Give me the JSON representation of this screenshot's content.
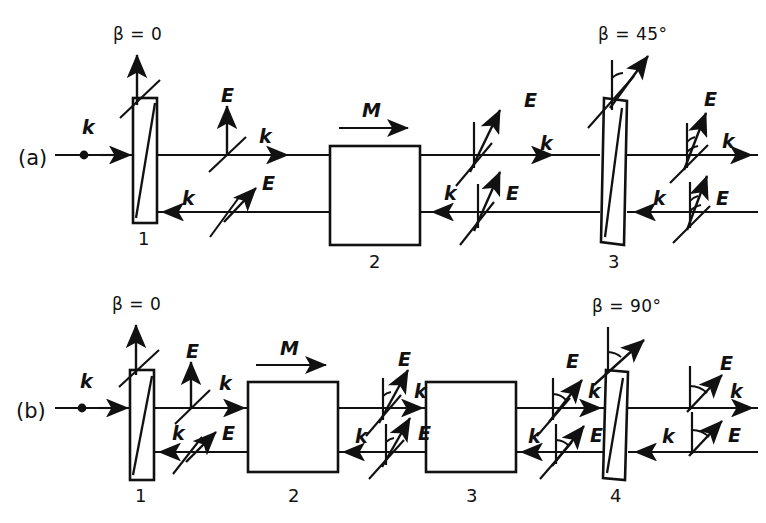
{
  "figure": {
    "type": "optical-schematic",
    "background_color": "#ffffff",
    "ink_color": "#111111"
  },
  "panels": [
    {
      "id": "a",
      "label": "(a)",
      "input_vector_label": "k",
      "magnetization_label": "M",
      "beta_labels": [
        {
          "text": "β = 0",
          "element": "1"
        },
        {
          "text": "β = 45°",
          "element": "3"
        }
      ],
      "elements": [
        {
          "number": "1",
          "kind": "polarizer",
          "angle_deg": 0
        },
        {
          "number": "2",
          "kind": "faraday-rotator"
        },
        {
          "number": "3",
          "kind": "polarizer",
          "angle_deg": 45
        }
      ],
      "vector_clusters": [
        {
          "position": "after-1",
          "beam": "forward",
          "E_label": "E",
          "k_label": "k",
          "E_angle_deg": 90
        },
        {
          "position": "after-1",
          "beam": "backward",
          "E_label": "E",
          "k_label": "k",
          "E_angle_deg": 45
        },
        {
          "position": "after-2",
          "beam": "forward",
          "E_label": "E",
          "k_label": "k",
          "E_angle_deg": 70
        },
        {
          "position": "after-2",
          "beam": "backward",
          "E_label": "E",
          "k_label": "k",
          "E_angle_deg": 70
        },
        {
          "position": "after-3",
          "beam": "forward",
          "E_label": "E",
          "k_label": "k",
          "E_angle_deg": 78
        },
        {
          "position": "after-3",
          "beam": "backward",
          "E_label": "E",
          "k_label": "k",
          "E_angle_deg": 78
        }
      ]
    },
    {
      "id": "b",
      "label": "(b)",
      "input_vector_label": "k",
      "magnetization_label": "M",
      "beta_labels": [
        {
          "text": "β = 0",
          "element": "1"
        },
        {
          "text": "β = 90°",
          "element": "4"
        }
      ],
      "elements": [
        {
          "number": "1",
          "kind": "polarizer",
          "angle_deg": 0
        },
        {
          "number": "2",
          "kind": "faraday-rotator"
        },
        {
          "number": "3",
          "kind": "faraday-rotator"
        },
        {
          "number": "4",
          "kind": "polarizer",
          "angle_deg": 90
        }
      ],
      "vector_clusters": [
        {
          "position": "after-1",
          "beam": "forward",
          "E_label": "E",
          "k_label": "k",
          "E_angle_deg": 90
        },
        {
          "position": "after-1",
          "beam": "backward",
          "E_label": "E",
          "k_label": "k",
          "E_angle_deg": 45
        },
        {
          "position": "after-2",
          "beam": "forward",
          "E_label": "E",
          "k_label": "k",
          "E_angle_deg": 68
        },
        {
          "position": "after-2",
          "beam": "backward",
          "E_label": "E",
          "k_label": "k",
          "E_angle_deg": 68
        },
        {
          "position": "after-3",
          "beam": "forward",
          "E_label": "E",
          "k_label": "k",
          "E_angle_deg": 52
        },
        {
          "position": "after-3",
          "beam": "backward",
          "E_label": "E",
          "k_label": "k",
          "E_angle_deg": 52
        },
        {
          "position": "after-4",
          "beam": "forward",
          "E_label": "E",
          "k_label": "k",
          "E_angle_deg": 45
        },
        {
          "position": "after-4",
          "beam": "backward",
          "E_label": "E",
          "k_label": "k",
          "E_angle_deg": 45
        }
      ]
    }
  ],
  "glyphs": {
    "E": "E",
    "k": "k",
    "M": "M",
    "beta_zero": "β = 0",
    "beta_45": "β = 45°",
    "beta_90": "β = 90°",
    "panel_a": "(a)",
    "panel_b": "(b)",
    "num_1": "1",
    "num_2": "2",
    "num_3": "3",
    "num_4": "4"
  }
}
